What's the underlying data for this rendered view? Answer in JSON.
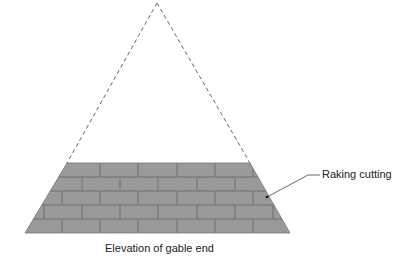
{
  "diagram": {
    "labels": {
      "raking_cutting": "Raking cutting",
      "caption": "Elevation of gable end"
    },
    "colors": {
      "brick_fill": "#9a9a9a",
      "mortar": "#6e6e6e",
      "outline": "#555555",
      "dashed_line": "#666666",
      "leader": "#444444"
    },
    "geometry": {
      "apex": [
        157,
        3
      ],
      "wall_top_left": [
        67,
        163
      ],
      "wall_top_right": [
        250,
        163
      ],
      "wall_bottom_left": [
        25,
        233
      ],
      "wall_bottom_right": [
        290,
        233
      ],
      "brick_courses": 5,
      "course_height": 14,
      "brick_length": 38
    }
  }
}
